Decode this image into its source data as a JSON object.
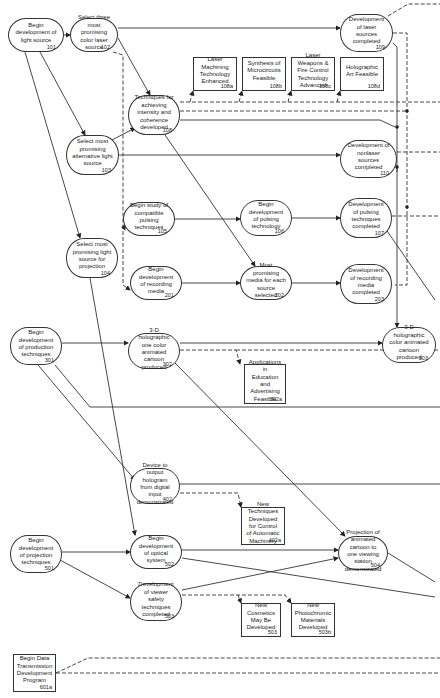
{
  "diagram": {
    "nodes": [
      {
        "id": "101",
        "text": "Begin development of light source",
        "num": "101",
        "shape": "round",
        "x": 8,
        "y": 18,
        "w": 56,
        "h": 34
      },
      {
        "id": "102",
        "text": "Select three most promising color laser source",
        "num": "102",
        "shape": "round",
        "x": 70,
        "y": 18,
        "w": 48,
        "h": 34
      },
      {
        "id": "108",
        "text": "Techniques for achieving intensity and coherence developed",
        "num": "108",
        "shape": "round",
        "x": 128,
        "y": 95,
        "w": 52,
        "h": 40
      },
      {
        "id": "108a",
        "text": "Laser Machining Technology Enhanced",
        "num": "108a",
        "shape": "box",
        "x": 193,
        "y": 57,
        "w": 44,
        "h": 34
      },
      {
        "id": "108b",
        "text": "Synthesis of Microcircuits Feasible",
        "num": "108b",
        "shape": "box",
        "x": 242,
        "y": 57,
        "w": 44,
        "h": 34
      },
      {
        "id": "108c",
        "text": "Laser Weapons & Fire Control Technology Advanced",
        "num": "108c",
        "shape": "box",
        "x": 291,
        "y": 57,
        "w": 44,
        "h": 34
      },
      {
        "id": "108d",
        "text": "Holographic Art Feasible",
        "num": "108d",
        "shape": "box",
        "x": 340,
        "y": 57,
        "w": 44,
        "h": 34
      },
      {
        "id": "109",
        "text": "Development of laser sources completed",
        "num": "109",
        "shape": "round",
        "x": 340,
        "y": 14,
        "w": 53,
        "h": 38
      },
      {
        "id": "103",
        "text": "Select most promising alternative light source",
        "num": "103",
        "shape": "round",
        "x": 66,
        "y": 135,
        "w": 53,
        "h": 40
      },
      {
        "id": "110",
        "text": "Development of nonlaser sources completed",
        "num": "110",
        "shape": "round",
        "x": 340,
        "y": 140,
        "w": 57,
        "h": 38
      },
      {
        "id": "105",
        "text": "Begin study of compatible pulsing techniques",
        "num": "105",
        "shape": "round",
        "x": 123,
        "y": 202,
        "w": 52,
        "h": 34
      },
      {
        "id": "106",
        "text": "Begin development of pulsing technology",
        "num": "106",
        "shape": "round",
        "x": 240,
        "y": 200,
        "w": 52,
        "h": 36
      },
      {
        "id": "107",
        "text": "Development of pulsing techniques completed",
        "num": "107",
        "shape": "round",
        "x": 340,
        "y": 198,
        "w": 52,
        "h": 40
      },
      {
        "id": "104",
        "text": "Select most promising light source for projection",
        "num": "104",
        "shape": "round",
        "x": 66,
        "y": 238,
        "w": 52,
        "h": 40
      },
      {
        "id": "201",
        "text": "Begin development of recording media",
        "num": "201",
        "shape": "round",
        "x": 130,
        "y": 266,
        "w": 52,
        "h": 34
      },
      {
        "id": "202",
        "text": "Most promising media for each source selected",
        "num": "202",
        "shape": "round",
        "x": 240,
        "y": 266,
        "w": 52,
        "h": 34
      },
      {
        "id": "203",
        "text": "Development of recording media completed",
        "num": "203",
        "shape": "round",
        "x": 340,
        "y": 264,
        "w": 52,
        "h": 40
      },
      {
        "id": "303",
        "text": "3-D holographic color animated cartoon produced",
        "num": "303",
        "shape": "round",
        "x": 382,
        "y": 327,
        "w": 54,
        "h": 36
      },
      {
        "id": "301",
        "text": "Begin development of production techniques",
        "num": "301",
        "shape": "round",
        "x": 10,
        "y": 327,
        "w": 52,
        "h": 38
      },
      {
        "id": "302",
        "text": "3-D holographic one color animated cartoon produced",
        "num": "302",
        "shape": "round",
        "x": 128,
        "y": 333,
        "w": 52,
        "h": 36
      },
      {
        "id": "302a",
        "text": "Applications in Education and Advertising Feasible",
        "num": "302a",
        "shape": "box",
        "x": 244,
        "y": 364,
        "w": 42,
        "h": 40
      },
      {
        "id": "402",
        "text": "Device to output hologram from digital input demonstrated",
        "num": "402",
        "shape": "round",
        "x": 130,
        "y": 468,
        "w": 50,
        "h": 36
      },
      {
        "id": "402a",
        "text": "New Techniques Developed for Control of Automatic Machinery",
        "num": "402a",
        "shape": "box",
        "x": 241,
        "y": 507,
        "w": 44,
        "h": 38
      },
      {
        "id": "501",
        "text": "Begin development of projection techniques",
        "num": "501",
        "shape": "round",
        "x": 10,
        "y": 535,
        "w": 52,
        "h": 38
      },
      {
        "id": "502",
        "text": "Begin development of optical system",
        "num": "502",
        "shape": "round",
        "x": 130,
        "y": 535,
        "w": 52,
        "h": 34
      },
      {
        "id": "503",
        "text": "Development of viewer safety techniques completed",
        "num": "503",
        "shape": "round",
        "x": 130,
        "y": 583,
        "w": 52,
        "h": 38
      },
      {
        "id": "504",
        "text": "Projection of animated cartoon to one viewing station demonstrated",
        "num": "504",
        "shape": "round",
        "x": 338,
        "y": 536,
        "w": 50,
        "h": 34
      },
      {
        "id": "503a",
        "text": "New Cosmetics May Be Developed",
        "num": "503",
        "shape": "box",
        "x": 241,
        "y": 603,
        "w": 40,
        "h": 34
      },
      {
        "id": "503b",
        "text": "New Photochromic Materials Developed",
        "num": "503b",
        "shape": "box",
        "x": 291,
        "y": 603,
        "w": 44,
        "h": 34
      },
      {
        "id": "601a",
        "text": "Begin Data Transmission Development Program",
        "num": "601a",
        "shape": "box",
        "x": 13,
        "y": 654,
        "w": 43,
        "h": 38
      }
    ]
  }
}
